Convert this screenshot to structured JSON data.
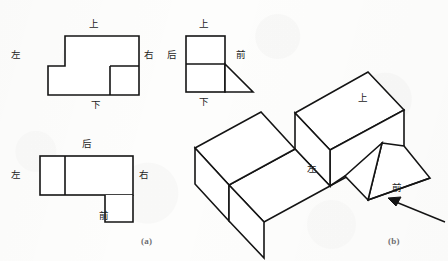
{
  "figure": {
    "title_absent": true,
    "background_color": "#fdfdfc",
    "stroke_color": "#1a1a1a",
    "captions": {
      "a": "(a)",
      "b": "(b)"
    }
  },
  "views": {
    "top_view": {
      "name": "俯视图—上方视图",
      "labels": {
        "top": "上",
        "left": "左",
        "right": "右",
        "bottom": "下"
      }
    },
    "side_view": {
      "name": "左侧视图",
      "labels": {
        "top": "上",
        "left": "后",
        "right": "前",
        "bottom": "下"
      }
    },
    "bottom_view": {
      "name": "仰视图",
      "labels": {
        "top": "后",
        "left": "左",
        "right": "右",
        "bottom": "前"
      }
    },
    "isometric": {
      "name": "立体图",
      "labels": {
        "top_face": "上",
        "left_face": "左",
        "front_face": "前"
      }
    }
  },
  "geometry": {
    "top_view_outline": "65,36 139,36 139,95 48,95 48,66 65,66",
    "top_view_inner_rect": "110,66 139,66 139,95 110,95",
    "side_view_square": "186,36 225,36 225,92 186,92",
    "side_view_divider": "186,64 225,64",
    "side_view_triangle": "225,64 253,92 225,92",
    "bottom_view_rect": "40,156 133,156 133,195 40,195",
    "bottom_view_divider": "65,156 65,195",
    "bottom_view_small_rect": "105,195 133,195 133,222 105,222",
    "iso_top_face": "368,72 404,110 330,150 295,113",
    "iso_arrow": "445,222 388,198"
  }
}
